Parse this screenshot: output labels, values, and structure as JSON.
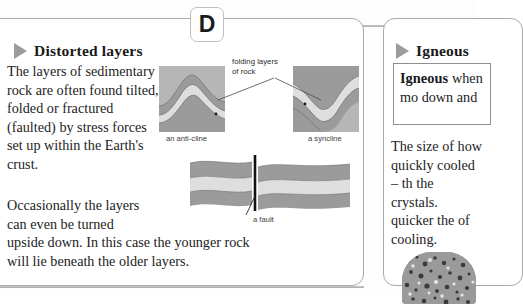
{
  "page": {
    "section_marker": "D"
  },
  "left_panel": {
    "heading": "Distorted layers",
    "marker_icon": "triangle-right-icon",
    "paragraph_1": "The layers of sedimentary rock are often found tilted, folded or fractured (faulted) by stress forces set up within the Earth's crust.",
    "paragraph_2": "Occasionally the layers can even be turned",
    "paragraph_3": "upside down. In this case the younger rock will lie beneath the older layers.",
    "figures": {
      "anticline": {
        "caption": "an anti-cline",
        "name": "anticline-diagram"
      },
      "syncline": {
        "caption": "a syncline",
        "name": "syncline-diagram"
      },
      "fault": {
        "caption": "a fault",
        "name": "fault-diagram"
      },
      "annotation_folding": "folding layers of rock"
    }
  },
  "right_panel": {
    "heading": "Igneous",
    "marker_icon": "triangle-right-icon",
    "definition_term": "Igneous",
    "definition_body": "when mo down and",
    "paragraph_1": "The size of how quickly cooled – th the crystals. quicker the of cooling.",
    "photo": "granite-rock-photo"
  },
  "colors": {
    "panel_border": "#a8aaad",
    "rule": "#a9abae",
    "marker_triangle": "#9a9c9f",
    "rock_dark": "#9b9b9b",
    "rock_mid": "#b4b4b4",
    "rock_light": "#dcdcdc",
    "fault_line": "#121212",
    "text": "#232323"
  }
}
